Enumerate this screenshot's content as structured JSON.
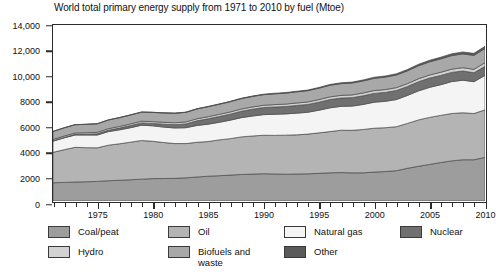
{
  "chart_data": {
    "type": "area",
    "title": "World total primary energy supply from 1971 to 2010 by fuel (Mtoe)",
    "xlabel": "",
    "ylabel": "",
    "unit": "Mtoe",
    "stacked": true,
    "grid": false,
    "legend_position": "bottom",
    "xlim": [
      1971,
      2010
    ],
    "ylim": [
      0,
      14000
    ],
    "ytick_labels": [
      "0",
      "2000",
      "4000",
      "6000",
      "8000",
      "10,000",
      "12,000",
      "14,000"
    ],
    "ytick_values": [
      0,
      2000,
      4000,
      6000,
      8000,
      10000,
      12000,
      14000
    ],
    "xtick_labels": [
      "1975",
      "1980",
      "1985",
      "1990",
      "1995",
      "2000",
      "2005",
      "2010"
    ],
    "xtick_values": [
      1975,
      1980,
      1985,
      1990,
      1995,
      2000,
      2005,
      2010
    ],
    "x": [
      1971,
      1972,
      1973,
      1974,
      1975,
      1976,
      1977,
      1978,
      1979,
      1980,
      1981,
      1982,
      1983,
      1984,
      1985,
      1986,
      1987,
      1988,
      1989,
      1990,
      1991,
      1992,
      1993,
      1994,
      1995,
      1996,
      1997,
      1998,
      1999,
      2000,
      2001,
      2002,
      2003,
      2004,
      2005,
      2006,
      2007,
      2008,
      2009,
      2010
    ],
    "series": [
      {
        "name": "Coal/peat",
        "color": "#9d9d9d",
        "values": [
          1450,
          1480,
          1510,
          1530,
          1560,
          1610,
          1650,
          1690,
          1740,
          1780,
          1790,
          1800,
          1840,
          1910,
          1970,
          2010,
          2060,
          2110,
          2140,
          2170,
          2150,
          2130,
          2150,
          2160,
          2200,
          2240,
          2260,
          2240,
          2240,
          2300,
          2340,
          2410,
          2600,
          2760,
          2910,
          3060,
          3190,
          3280,
          3280,
          3470
        ]
      },
      {
        "name": "Oil",
        "color": "#b4b4b4",
        "values": [
          2420,
          2600,
          2760,
          2710,
          2670,
          2830,
          2900,
          2990,
          3070,
          2970,
          2860,
          2770,
          2730,
          2760,
          2760,
          2850,
          2900,
          2990,
          3030,
          3060,
          3070,
          3110,
          3110,
          3160,
          3220,
          3280,
          3370,
          3380,
          3450,
          3490,
          3490,
          3500,
          3570,
          3690,
          3740,
          3750,
          3770,
          3740,
          3680,
          3780
        ]
      },
      {
        "name": "Natural gas",
        "color": "#f4f4f4",
        "values": [
          890,
          940,
          980,
          1010,
          1020,
          1080,
          1110,
          1150,
          1220,
          1230,
          1230,
          1240,
          1260,
          1340,
          1380,
          1400,
          1470,
          1530,
          1590,
          1640,
          1680,
          1690,
          1730,
          1740,
          1800,
          1890,
          1900,
          1930,
          1990,
          2070,
          2100,
          2160,
          2230,
          2310,
          2390,
          2440,
          2540,
          2590,
          2530,
          2740
        ]
      },
      {
        "name": "Nuclear",
        "color": "#707070",
        "values": [
          30,
          40,
          50,
          60,
          90,
          110,
          140,
          170,
          180,
          190,
          230,
          260,
          300,
          370,
          430,
          460,
          480,
          510,
          540,
          560,
          580,
          590,
          610,
          620,
          640,
          660,
          660,
          670,
          690,
          700,
          710,
          720,
          710,
          730,
          740,
          740,
          730,
          730,
          710,
          720
        ]
      },
      {
        "name": "Hydro",
        "color": "#d2d2d2",
        "values": [
          104,
          108,
          110,
          118,
          122,
          124,
          128,
          134,
          139,
          143,
          147,
          151,
          158,
          163,
          167,
          170,
          173,
          178,
          180,
          184,
          187,
          190,
          196,
          199,
          204,
          212,
          213,
          218,
          222,
          225,
          226,
          225,
          226,
          235,
          240,
          250,
          258,
          266,
          272,
          295
        ]
      },
      {
        "name": "Biofuels and waste",
        "color": "#a8a8a8",
        "values": [
          640,
          650,
          660,
          670,
          680,
          690,
          700,
          710,
          720,
          735,
          745,
          755,
          765,
          780,
          795,
          805,
          815,
          825,
          835,
          845,
          860,
          870,
          885,
          895,
          910,
          925,
          935,
          945,
          960,
          975,
          990,
          1005,
          1020,
          1035,
          1050,
          1065,
          1080,
          1095,
          1110,
          1130
        ]
      },
      {
        "name": "Other",
        "color": "#5a5a5a",
        "values": [
          4,
          5,
          5,
          6,
          7,
          8,
          9,
          10,
          11,
          12,
          13,
          15,
          17,
          19,
          22,
          25,
          28,
          31,
          34,
          38,
          42,
          46,
          50,
          54,
          58,
          63,
          68,
          73,
          79,
          85,
          92,
          99,
          107,
          115,
          124,
          133,
          143,
          153,
          163,
          175
        ]
      }
    ],
    "legend_entries": [
      {
        "label": "Coal/peat",
        "color": "#9d9d9d"
      },
      {
        "label": "Oil",
        "color": "#b4b4b4"
      },
      {
        "label": "Natural gas",
        "color": "#f4f4f4"
      },
      {
        "label": "Nuclear",
        "color": "#707070"
      },
      {
        "label": "Hydro",
        "color": "#d2d2d2"
      },
      {
        "label": "Biofuels and\nwaste",
        "color": "#a8a8a8"
      },
      {
        "label": "Other",
        "color": "#5a5a5a"
      }
    ],
    "colors": {
      "axis": "#2b2b2b",
      "text": "#111111",
      "background": "#ffffff",
      "outline": "#3a3a3a"
    }
  }
}
